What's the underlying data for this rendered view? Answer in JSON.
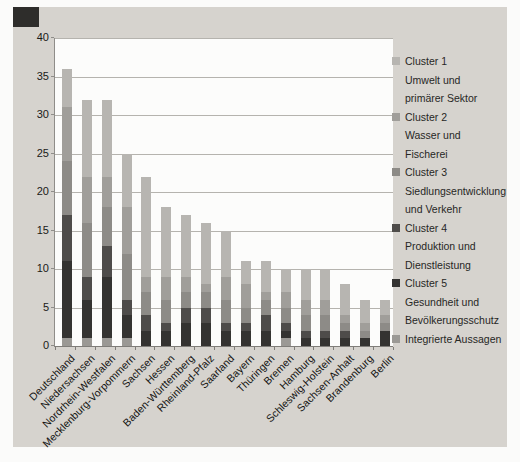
{
  "figure": {
    "kind": "scanned grayscale stacked column chart",
    "background_color": "#d6d3ce",
    "plot_background": "#fcfcfb",
    "gridline_color": "#b5b3ae"
  },
  "chart_data": {
    "type": "bar",
    "stacked": true,
    "title": "",
    "xlabel": "",
    "ylabel": "",
    "ylim": [
      0,
      40
    ],
    "yticks": [
      0,
      5,
      10,
      15,
      20,
      25,
      30,
      35,
      40
    ],
    "grid": true,
    "legend_position": "right",
    "categories": [
      "Deutschland",
      "Niedersachsen",
      "Nordrhein-Westfalen",
      "Mecklenburg-Vorpommern",
      "Sachsen",
      "Hessen",
      "Baden-Württemberg",
      "Rheinland-Pfalz",
      "Saarland",
      "Bayern",
      "Thüringen",
      "Bremen",
      "Hamburg",
      "Schleswig-Holstein",
      "Sachsen-Anhalt",
      "Brandenburg",
      "Berlin"
    ],
    "totals": [
      36,
      32,
      32,
      25,
      22,
      18,
      17,
      16,
      15,
      11,
      11,
      10,
      10,
      10,
      8,
      6,
      6
    ],
    "series_bottom_to_top_order": [
      "Integrierte Aussagen",
      "Cluster 5",
      "Cluster 4",
      "Cluster 3",
      "Cluster 2",
      "Cluster 1"
    ],
    "series": [
      {
        "name": "Cluster 1",
        "color": "#b7b5b1",
        "values": [
          5,
          10,
          10,
          7,
          13,
          9,
          8,
          8,
          6,
          3,
          4,
          3,
          4,
          4,
          4,
          3,
          2
        ]
      },
      {
        "name": "Cluster 2",
        "color": "#a09e9a",
        "values": [
          7,
          6,
          4,
          6,
          2,
          3,
          2,
          1,
          3,
          3,
          1,
          2,
          2,
          2,
          1,
          1,
          1
        ]
      },
      {
        "name": "Cluster 3",
        "color": "#8d8b87",
        "values": [
          7,
          7,
          5,
          6,
          3,
          3,
          2,
          2,
          3,
          2,
          2,
          2,
          2,
          2,
          1,
          1,
          1
        ]
      },
      {
        "name": "Cluster 4",
        "color": "#4e4c4a",
        "values": [
          6,
          3,
          4,
          2,
          2,
          1,
          2,
          2,
          1,
          1,
          2,
          1,
          1,
          1,
          1,
          0,
          0
        ]
      },
      {
        "name": "Cluster 5",
        "color": "#343331",
        "values": [
          10,
          5,
          8,
          3,
          2,
          2,
          3,
          3,
          2,
          2,
          2,
          1,
          1,
          1,
          1,
          1,
          2
        ]
      },
      {
        "name": "Integrierte Aussagen",
        "color": "#9b9995",
        "values": [
          1,
          1,
          1,
          1,
          0,
          0,
          0,
          0,
          0,
          0,
          0,
          1,
          0,
          0,
          0,
          0,
          0
        ]
      }
    ]
  },
  "legend": {
    "items": [
      {
        "series": "Cluster 1",
        "color": "#b7b5b1",
        "lines": [
          "Cluster 1",
          "Umwelt und",
          "primärer Sektor"
        ]
      },
      {
        "series": "Cluster 2",
        "color": "#a09e9a",
        "lines": [
          "Cluster 2",
          "Wasser und",
          "Fischerei"
        ]
      },
      {
        "series": "Cluster 3",
        "color": "#8d8b87",
        "lines": [
          "Cluster 3",
          "Siedlungsentwicklung",
          "und Verkehr"
        ]
      },
      {
        "series": "Cluster 4",
        "color": "#4e4c4a",
        "lines": [
          "Cluster 4",
          "Produktion und",
          "Dienstleistung"
        ]
      },
      {
        "series": "Cluster 5",
        "color": "#343331",
        "lines": [
          "Cluster 5",
          "Gesundheit und",
          "Bevölkerungsschutz"
        ]
      },
      {
        "series": "Integrierte Aussagen",
        "color": "#9b9995",
        "lines": [
          "Integrierte Aussagen"
        ]
      }
    ]
  }
}
